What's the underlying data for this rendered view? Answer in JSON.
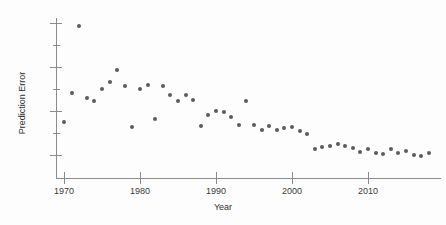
{
  "chart_data": {
    "type": "scatter",
    "title": "",
    "xlabel": "Year",
    "ylabel": "Prediction Error",
    "xlim": [
      1968.5,
      2019.5
    ],
    "ylim": [
      60,
      730
    ],
    "grid": false,
    "legend": null,
    "x_ticks": [
      1970,
      1980,
      1990,
      2000,
      2010
    ],
    "x_tick_labels": [
      "1970",
      "1980",
      "1990",
      "2000",
      "2010"
    ],
    "y_ticks": [
      100,
      300,
      500,
      700
    ],
    "y_tick_labels": [
      "100",
      "300",
      "500",
      "700"
    ],
    "y_minor_ticks": [
      200,
      400,
      600
    ],
    "marker_color": "#5a5a60",
    "axis_color": "#8b8b8b",
    "series": [
      {
        "name": "Prediction Error",
        "x": [
          1970,
          1971,
          1972,
          1973,
          1974,
          1975,
          1976,
          1977,
          1978,
          1979,
          1980,
          1981,
          1982,
          1983,
          1984,
          1985,
          1986,
          1987,
          1988,
          1989,
          1990,
          1991,
          1992,
          1993,
          1994,
          1995,
          1996,
          1997,
          1998,
          1999,
          2000,
          2001,
          2002,
          2003,
          2004,
          2005,
          2006,
          2007,
          2008,
          2009,
          2010,
          2011,
          2012,
          2013,
          2014,
          2015,
          2016,
          2017,
          2018
        ],
        "y": [
          250,
          380,
          685,
          360,
          345,
          400,
          430,
          485,
          415,
          228,
          400,
          420,
          262,
          415,
          375,
          345,
          372,
          348,
          230,
          280,
          300,
          296,
          272,
          238,
          345,
          235,
          213,
          230,
          215,
          222,
          226,
          208,
          197,
          128,
          138,
          142,
          148,
          140,
          132,
          114,
          126,
          110,
          104,
          128,
          108,
          120,
          98,
          96,
          108
        ]
      }
    ]
  }
}
